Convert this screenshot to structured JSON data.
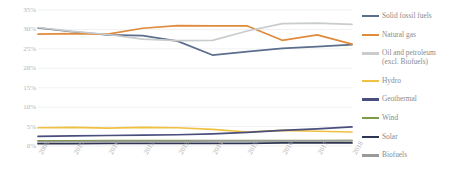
{
  "chart_data": {
    "type": "line",
    "title": "",
    "subtitle": "",
    "xlabel": "",
    "ylabel": "",
    "grid": true,
    "legend_position": "right",
    "ylim": [
      0,
      35
    ],
    "y_unit": "%",
    "y_ticks": [
      "0%",
      "5%",
      "10%",
      "15%",
      "20%",
      "25%",
      "30%",
      "35%"
    ],
    "y_tick_values": [
      0,
      5,
      10,
      15,
      20,
      25,
      30,
      35
    ],
    "categories": [
      "2009",
      "2010",
      "2011",
      "2012",
      "2013",
      "2014",
      "2015",
      "2016",
      "2017",
      "2018"
    ],
    "x": [
      2009,
      2010,
      2011,
      2012,
      2013,
      2014,
      2015,
      2016,
      2017,
      2018
    ],
    "series": [
      {
        "name": "Solid fossil fuels",
        "color": "#5b6e8c",
        "values": [
          30.4,
          29.4,
          28.6,
          28.4,
          27.0,
          23.4,
          24.3,
          25.1,
          25.6,
          26.1
        ]
      },
      {
        "name": "Natural gas",
        "color": "#e08a3c",
        "values": [
          28.8,
          28.9,
          28.8,
          30.3,
          31.0,
          30.9,
          30.9,
          27.2,
          28.6,
          26.2
        ]
      },
      {
        "name": "Oil and petroleum\n(excl. Biofuels)",
        "color": "#c9cccd",
        "values": [
          30.5,
          29.5,
          28.7,
          27.5,
          27.1,
          27.2,
          29.6,
          31.5,
          31.6,
          31.3
        ]
      },
      {
        "name": "Hydro",
        "color": "#f0c040",
        "values": [
          4.7,
          4.8,
          4.6,
          4.8,
          4.7,
          4.3,
          3.6,
          4.0,
          3.8,
          3.6
        ]
      },
      {
        "name": "Geothermal",
        "color": "#4a4e7c",
        "values": [
          2.5,
          2.6,
          2.7,
          2.8,
          2.9,
          3.1,
          3.5,
          4.0,
          4.4,
          4.9
        ]
      },
      {
        "name": "Wind",
        "color": "#7e9a4a",
        "values": [
          1.3,
          1.3,
          1.4,
          1.4,
          1.4,
          1.4,
          1.4,
          1.4,
          1.4,
          1.4
        ]
      },
      {
        "name": "Solar",
        "color": "#2e3550",
        "values": [
          0.6,
          0.6,
          0.7,
          0.7,
          0.7,
          0.7,
          0.7,
          0.8,
          0.8,
          0.8
        ]
      },
      {
        "name": "Biofuels",
        "color": "#9a9a9a",
        "values": [
          1.1,
          1.1,
          1.2,
          1.2,
          1.2,
          1.3,
          1.3,
          1.3,
          1.3,
          1.4
        ]
      }
    ]
  },
  "legend": {
    "items": [
      {
        "label": "Solid fossil fuels",
        "color": "#5b6e8c"
      },
      {
        "label": "Natural gas",
        "color": "#e08a3c"
      },
      {
        "label": "Oil and petroleum\n(excl. Biofuels)",
        "color": "#c9cccd"
      },
      {
        "label": "Hydro",
        "color": "#f0c040"
      },
      {
        "label": "Geothermal",
        "color": "#4a4e7c"
      },
      {
        "label": "Wind",
        "color": "#7e9a4a"
      },
      {
        "label": "Solar",
        "color": "#2e3550"
      },
      {
        "label": "Biofuels",
        "color": "#9a9a9a"
      }
    ]
  },
  "style": {
    "gridline_color": "#ededed",
    "axis_label_color": "#b4b4b4",
    "legend_text_color": "#8a8a8a",
    "background": "#ffffff"
  }
}
